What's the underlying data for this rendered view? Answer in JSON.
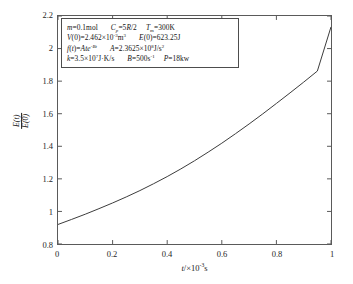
{
  "chart_data": {
    "type": "line",
    "title": "",
    "xlabel": "t/×10⁻³s",
    "ylabel": "E(t)/E(0)",
    "xlim": [
      0,
      1
    ],
    "ylim": [
      0.8,
      2.2
    ],
    "grid": false,
    "legend": "none",
    "xticks": [
      "0",
      "0.2",
      "0.4",
      "0.6",
      "0.8",
      "1"
    ],
    "xtick_values": [
      0,
      0.2,
      0.4,
      0.6,
      0.8,
      1
    ],
    "yticks": [
      "0.8",
      "1",
      "1.2",
      "1.4",
      "1.6",
      "1.8",
      "2",
      "2.2"
    ],
    "ytick_values": [
      0.8,
      1.0,
      1.2,
      1.4,
      1.6,
      1.8,
      2.0,
      2.2
    ],
    "series": [
      {
        "name": "E(t)/E(0)",
        "color": "#3c3c3c",
        "x": [
          0.0,
          0.05,
          0.1,
          0.15,
          0.2,
          0.25,
          0.3,
          0.35,
          0.4,
          0.45,
          0.5,
          0.55,
          0.6,
          0.65,
          0.7,
          0.75,
          0.8,
          0.85,
          0.9,
          0.95,
          1.0
        ],
        "y": [
          0.92,
          0.951,
          0.983,
          1.017,
          1.052,
          1.089,
          1.128,
          1.17,
          1.214,
          1.261,
          1.311,
          1.364,
          1.419,
          1.477,
          1.537,
          1.599,
          1.663,
          1.728,
          1.794,
          1.862,
          2.133
        ]
      }
    ],
    "annotation": {
      "border_color": "#4d4d4d",
      "lines": [
        {
          "id": "line-1",
          "parts": [
            {
              "text": "m",
              "style": "italic"
            },
            {
              "text": "=0.1mol",
              "style": "normal"
            },
            {
              "text": "gap-m",
              "style": "gap"
            },
            {
              "text": "C",
              "style": "italic"
            },
            {
              "text": "p",
              "style": "sub-italic"
            },
            {
              "text": "=5",
              "style": "normal"
            },
            {
              "text": "R",
              "style": "italic"
            },
            {
              "text": "/2",
              "style": "normal"
            },
            {
              "text": "gap-s",
              "style": "gap"
            },
            {
              "text": "T",
              "style": "italic"
            },
            {
              "text": "m",
              "style": "sub"
            },
            {
              "text": "=300K",
              "style": "normal"
            }
          ],
          "plain": "m=0.1mol  Cp=5R/2  Tm=300K"
        },
        {
          "id": "line-2",
          "parts": [
            {
              "text": "V",
              "style": "italic"
            },
            {
              "text": "(0)=2.462×10",
              "style": "normal"
            },
            {
              "text": "-3",
              "style": "sup"
            },
            {
              "text": "m",
              "style": "normal"
            },
            {
              "text": "3",
              "style": "sup"
            },
            {
              "text": "gap-m",
              "style": "gap"
            },
            {
              "text": "E",
              "style": "italic"
            },
            {
              "text": "(0)=623.25J",
              "style": "normal"
            }
          ],
          "plain": "V(0)=2.462×10⁻³m³  E(0)=623.25J"
        },
        {
          "id": "line-3",
          "parts": [
            {
              "text": "f",
              "style": "italic"
            },
            {
              "text": "(",
              "style": "normal"
            },
            {
              "text": "t",
              "style": "italic"
            },
            {
              "text": ")=",
              "style": "normal"
            },
            {
              "text": "Ate",
              "style": "italic"
            },
            {
              "text": "-Bt",
              "style": "sup-italic"
            },
            {
              "text": "gap-m",
              "style": "gap"
            },
            {
              "text": "A",
              "style": "italic"
            },
            {
              "text": "=2.3625×10",
              "style": "normal"
            },
            {
              "text": "8",
              "style": "sup"
            },
            {
              "text": "J/s",
              "style": "normal"
            },
            {
              "text": "2",
              "style": "sup"
            }
          ],
          "plain": "f(t)=Ate⁻ᴮᵗ  A=2.3625×10⁸J/s²"
        },
        {
          "id": "line-4",
          "parts": [
            {
              "text": "k",
              "style": "italic"
            },
            {
              "text": "=3.5×10",
              "style": "normal"
            },
            {
              "text": "7",
              "style": "sup"
            },
            {
              "text": "J·K/s",
              "style": "normal"
            },
            {
              "text": "gap-m",
              "style": "gap"
            },
            {
              "text": "B",
              "style": "italic"
            },
            {
              "text": "=500s",
              "style": "normal"
            },
            {
              "text": "-1",
              "style": "sup"
            },
            {
              "text": "gap-s",
              "style": "gap"
            },
            {
              "text": "P",
              "style": "italic"
            },
            {
              "text": "=18kw",
              "style": "normal"
            }
          ],
          "plain": "k=3.5×10⁷J·K/s  B=500s⁻¹  P=18kw"
        }
      ]
    }
  },
  "axis": {
    "ylabel_numerator": "E(t)",
    "ylabel_denominator": "E(0)",
    "xlabel_variable": "t",
    "xlabel_rest": "/×10",
    "xlabel_exponent": "-3",
    "xlabel_unit": "s"
  },
  "colors": {
    "frame": "#5a5a5a",
    "curve": "#3c3c3c",
    "text": "#1a1a1a",
    "background": "#ffffff"
  }
}
